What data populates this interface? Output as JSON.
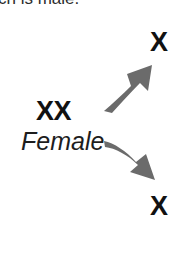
{
  "figure": {
    "background_color": "#ffffff",
    "text_color": "#111111",
    "arrow_color": "#6b6b6b",
    "clipped_caption": "ch is male.",
    "parent": {
      "genotype": "XX",
      "sex": "Female"
    },
    "gametes": [
      {
        "label": "X",
        "position": "top"
      },
      {
        "label": "X",
        "position": "bottom"
      }
    ],
    "arrows": [
      {
        "name": "arrow-to-top-gamete",
        "direction": "up-right",
        "glyph": "curved-arrow"
      },
      {
        "name": "arrow-to-bottom-gamete",
        "direction": "down-right",
        "glyph": "curved-arrow"
      }
    ]
  }
}
